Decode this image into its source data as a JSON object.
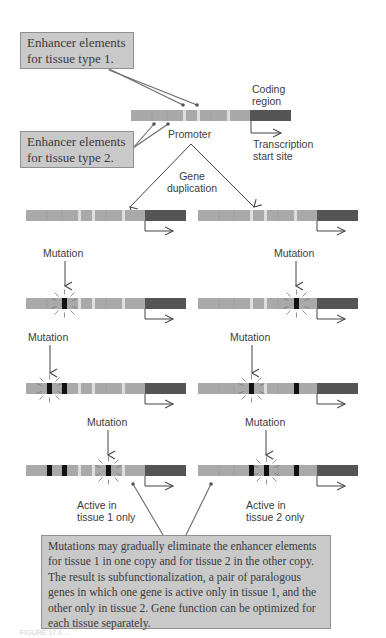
{
  "callouts": {
    "enhancer_tissue_1": {
      "line1": "Enhancer elements",
      "line2": "for tissue type 1."
    },
    "enhancer_tissue_2": {
      "line1": "Enhancer elements",
      "line2": "for tissue type 2."
    },
    "summary": "Mutations may gradually eliminate the enhancer elements for tissue 1 in one copy and for tissue 2 in the other copy. The result is subfunctionalization, a pair of paralogous genes in which one gene is active only in tissue 1, and the other only in tissue 2. Gene function can be optimized for each tissue separately."
  },
  "labels": {
    "coding_region_1": "Coding",
    "coding_region_2": "region",
    "promoter": "Promoter",
    "transcription_1": "Transcription",
    "transcription_2": "start site",
    "gene_duplication_1": "Gene",
    "gene_duplication_2": "duplication",
    "mutation": "Mutation",
    "active_tissue_1_a": "Active in",
    "active_tissue_1_b": "tissue 1 only",
    "active_tissue_2_a": "Active in",
    "active_tissue_2_b": "tissue 2 only"
  },
  "caption": "FIGURE 17.4 ...",
  "colors": {
    "callout_fill": "#c9c9c9",
    "callout_border": "#8f8f8f",
    "promoter_segment": "#aaaaaa",
    "coding_region": "#555555",
    "mutation_mark": "#111111",
    "arrow": "#444444",
    "text": "#3c3c3c"
  },
  "rows": [
    {
      "label": "duplicated copies",
      "left_mutations": [],
      "right_mutations": []
    },
    {
      "label": "mutation 1",
      "left_mutations": [
        1
      ],
      "right_mutations": [
        4
      ]
    },
    {
      "label": "mutation 2",
      "left_mutations": [
        1,
        2
      ],
      "right_mutations": [
        4,
        5
      ]
    },
    {
      "label": "mutation 3",
      "left_mutations": [
        1,
        2,
        4
      ],
      "right_mutations": [
        3,
        4,
        5
      ]
    }
  ]
}
